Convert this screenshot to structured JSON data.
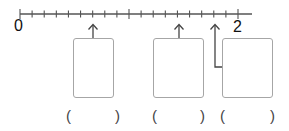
{
  "number_line": {
    "start_label": "0",
    "end_label": "2",
    "min": 0,
    "max": 2,
    "subdivisions_per_unit": 9,
    "line_color": "#555555"
  },
  "arrows": [
    {
      "position": "6/9",
      "value_index": 6
    },
    {
      "position": "1 4/9",
      "value_index": 13
    },
    {
      "position": "1 7/9",
      "value_index": 16
    }
  ],
  "answer_boxes": [
    {
      "value": ""
    },
    {
      "value": ""
    },
    {
      "value": ""
    }
  ],
  "answer_blanks": [
    {
      "open": "(",
      "close": ")",
      "value": ""
    },
    {
      "open": "(",
      "close": ")",
      "value": ""
    },
    {
      "open": "(",
      "close": ")",
      "value": ""
    }
  ],
  "colors": {
    "box_border": "#a6a6a6",
    "text": "#111111",
    "paren": "#444444"
  }
}
